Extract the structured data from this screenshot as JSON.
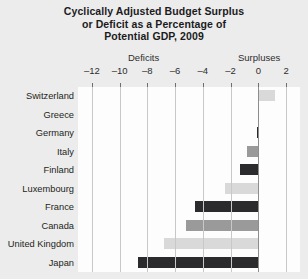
{
  "chart_data": {
    "type": "bar",
    "orientation": "horizontal",
    "title": "Cyclically Adjusted Budget Surplus or Deficit as a Percentage of Potential GDP, 2009",
    "title_lines": [
      "Cyclically Adjusted Budget Surplus",
      "or Deficit as a Percentage of",
      "Potential GDP, 2009"
    ],
    "xlabel": "",
    "ylabel": "",
    "group_labels": {
      "negative": "Deficits",
      "positive": "Surpluses"
    },
    "xlim": [
      -13,
      3
    ],
    "xticks": [
      -12,
      -10,
      -8,
      -6,
      -4,
      -2,
      0,
      2
    ],
    "xtick_labels": [
      "–12",
      "–10",
      "–8",
      "–6",
      "–4",
      "–2",
      "0",
      "2"
    ],
    "grid": true,
    "legend": "none",
    "categories": [
      "Switzerland",
      "Greece",
      "Germany",
      "Italy",
      "Finland",
      "Luxembourg",
      "France",
      "Canada",
      "United Kingdom",
      "Japan"
    ],
    "values": [
      1.2,
      0.0,
      -0.1,
      -0.8,
      -1.3,
      -2.4,
      -4.6,
      -5.2,
      -6.8,
      -8.7
    ],
    "bar_shades": [
      "light",
      "light",
      "dark",
      "mid",
      "dark",
      "light",
      "dark",
      "mid",
      "light",
      "dark"
    ],
    "colors": {
      "light": "#d9d9d9",
      "mid": "#9a9a9a",
      "dark": "#2b2b2d",
      "plot_background": "#fdfdfd",
      "page_background": "#ececec",
      "gridline": "#c8c8c8",
      "zeroline": "#8d8d8d",
      "text": "#231f20"
    }
  }
}
